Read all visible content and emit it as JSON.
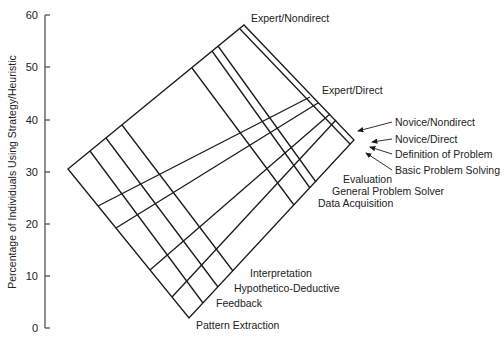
{
  "y_axis": {
    "label": "Percentage of Individuals Using Strategy/Heuristic",
    "ticks": [
      "0",
      "10",
      "20",
      "30",
      "40",
      "50",
      "60"
    ]
  },
  "labels": {
    "expert_nondirect": "Expert/Nondirect",
    "expert_direct": "Expert/Direct",
    "novice_nondirect": "Novice/Nondirect",
    "novice_direct": "Novice/Direct",
    "definition_of_problem": "Definition of Problem",
    "basic_problem_solving": "Basic Problem Solving",
    "evaluation": "Evaluation",
    "general_problem_solver": "General Problem Solver",
    "data_acquisition": "Data Acquisition",
    "interpretation": "Interpretation",
    "hypothetico_deductive": "Hypothetico-Deductive",
    "feedback": "Feedback",
    "pattern_extraction": "Pattern Extraction"
  }
}
